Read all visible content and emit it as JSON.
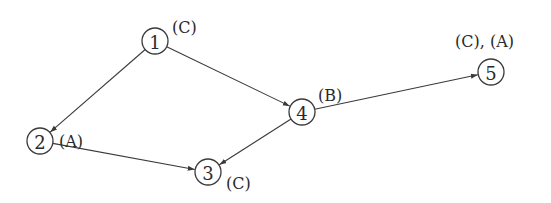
{
  "diagram": {
    "type": "directed-graph",
    "nodes": [
      {
        "id": "1",
        "label": "1",
        "x": 155,
        "y": 41,
        "annotation": "(C)",
        "ann_x": 172,
        "ann_y": 33
      },
      {
        "id": "2",
        "label": "2",
        "x": 40,
        "y": 141,
        "annotation": "(A)",
        "ann_x": 59,
        "ann_y": 147
      },
      {
        "id": "3",
        "label": "3",
        "x": 208,
        "y": 172,
        "annotation": "(C)",
        "ann_x": 226,
        "ann_y": 189
      },
      {
        "id": "4",
        "label": "4",
        "x": 302,
        "y": 112,
        "annotation": "(B)",
        "ann_x": 318,
        "ann_y": 101
      },
      {
        "id": "5",
        "label": "5",
        "x": 491,
        "y": 72,
        "annotation": "(C), (A)",
        "ann_x": 455,
        "ann_y": 47
      }
    ],
    "edges": [
      {
        "from": "1",
        "to": "2"
      },
      {
        "from": "1",
        "to": "4"
      },
      {
        "from": "2",
        "to": "3"
      },
      {
        "from": "4",
        "to": "3"
      },
      {
        "from": "4",
        "to": "5"
      }
    ],
    "node_radius": 13,
    "colors": {
      "stroke": "#3a3a3a",
      "text": "#2a2a2a",
      "background": "#ffffff"
    }
  }
}
